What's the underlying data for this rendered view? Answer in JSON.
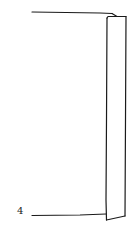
{
  "diagram": {
    "type": "patent-line-drawing",
    "labels": [
      {
        "id": "ref-4",
        "text": "4",
        "x": 17,
        "y": 205
      }
    ],
    "stroke_color": "#1a1a1a",
    "background": "#ffffff"
  }
}
